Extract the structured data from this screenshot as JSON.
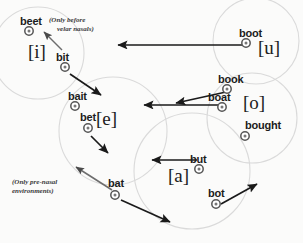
{
  "figure": {
    "background_color": "#fbfbfa",
    "circle_color": "#d9d9d9",
    "arrow_color": "#1a1a1a",
    "label_color": "#1c1c1c"
  },
  "vowel_regions": [
    {
      "id": "i",
      "symbol": "[i]",
      "cx": 38,
      "cy": 53,
      "r": 46
    },
    {
      "id": "e",
      "symbol": "[e]",
      "cx": 113,
      "cy": 131,
      "r": 54
    },
    {
      "id": "a",
      "symbol": "[a]",
      "cx": 192,
      "cy": 171,
      "r": 58
    },
    {
      "id": "u",
      "symbol": "[u]",
      "cx": 256,
      "cy": 41,
      "r": 43
    },
    {
      "id": "o",
      "symbol": "[o]",
      "cx": 252,
      "cy": 118,
      "r": 45
    }
  ],
  "ipa_symbols": [
    {
      "text": "[i]",
      "x": 28,
      "y": 42
    },
    {
      "text": "[e]",
      "x": 96,
      "y": 109
    },
    {
      "text": "[a]",
      "x": 168,
      "y": 166
    },
    {
      "text": "[u]",
      "x": 258,
      "y": 38
    },
    {
      "text": "[o]",
      "x": 243,
      "y": 93
    }
  ],
  "word_points": [
    {
      "word": "beet",
      "label_x": 20,
      "label_y": 16,
      "dot_x": 29,
      "dot_y": 31
    },
    {
      "word": "bit",
      "label_x": 56,
      "label_y": 52,
      "dot_x": 65,
      "dot_y": 67
    },
    {
      "word": "bait",
      "label_x": 68,
      "label_y": 91,
      "dot_x": 75,
      "dot_y": 106
    },
    {
      "word": "bet",
      "label_x": 80,
      "label_y": 112,
      "dot_x": 88,
      "dot_y": 128
    },
    {
      "word": "bat",
      "label_x": 108,
      "label_y": 178,
      "dot_x": 115,
      "dot_y": 195
    },
    {
      "word": "but",
      "label_x": 190,
      "label_y": 154,
      "dot_x": 199,
      "dot_y": 169
    },
    {
      "word": "bot",
      "label_x": 208,
      "label_y": 188,
      "dot_x": 216,
      "dot_y": 204
    },
    {
      "word": "boot",
      "label_x": 239,
      "label_y": 28,
      "dot_x": 246,
      "dot_y": 43
    },
    {
      "word": "book",
      "label_x": 218,
      "label_y": 74,
      "dot_x": 227,
      "dot_y": 89
    },
    {
      "word": "boat",
      "label_x": 208,
      "label_y": 92,
      "dot_x": 222,
      "dot_y": 107
    },
    {
      "word": "bought",
      "label_x": 245,
      "label_y": 120,
      "dot_x": 245,
      "dot_y": 136
    }
  ],
  "annotations": [
    {
      "id": "velar-nasal-note",
      "line1": "(Only before",
      "line2": "velar nasals)",
      "x": 49,
      "y": 16
    },
    {
      "id": "pre-nasal-note",
      "line1": "(Only pre-nasal",
      "line2": "environments)",
      "x": 12,
      "y": 178
    }
  ],
  "shift_arrows": [
    {
      "id": "boot-to-bit",
      "from": "boot",
      "to": "bit",
      "x1": 243,
      "y1": 45,
      "x2": 118,
      "y2": 45
    },
    {
      "id": "bit-to-bait",
      "from": "bit",
      "to": "bait",
      "x1": 70,
      "y1": 74,
      "x2": 101,
      "y2": 95
    },
    {
      "id": "bet-to-bat",
      "from": "bet",
      "to": "bat",
      "x1": 91,
      "y1": 136,
      "x2": 108,
      "y2": 153
    },
    {
      "id": "bat-to-nasal",
      "from": "bat",
      "to": "e",
      "x1": 112,
      "y1": 190,
      "x2": 76,
      "y2": 167
    },
    {
      "id": "bat-to-low",
      "from": "bat",
      "to": "a",
      "x1": 121,
      "y1": 200,
      "x2": 170,
      "y2": 222
    },
    {
      "id": "book-to-boat",
      "from": "book",
      "to": "boat",
      "x1": 226,
      "y1": 92,
      "x2": 176,
      "y2": 103
    },
    {
      "id": "boat-to-front",
      "from": "boat",
      "to": "e",
      "x1": 219,
      "y1": 105,
      "x2": 144,
      "y2": 105
    },
    {
      "id": "but-to-front",
      "from": "but",
      "to": "e",
      "x1": 197,
      "y1": 160,
      "x2": 152,
      "y2": 160
    },
    {
      "id": "bot-to-bought",
      "from": "bot",
      "to": "o",
      "x1": 221,
      "y1": 204,
      "x2": 257,
      "y2": 184
    },
    {
      "id": "beet-note",
      "from": "bit",
      "to": "beet",
      "x1": 61,
      "y1": 49,
      "x2": 44,
      "y2": 32
    }
  ]
}
